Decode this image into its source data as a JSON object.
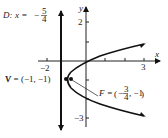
{
  "diagram": {
    "type": "parabola",
    "equation_note": "horizontal parabola opening right",
    "directrix": {
      "label": "D:",
      "lhs": "x =",
      "value_sign": "−",
      "num": "5",
      "den": "4"
    },
    "vertex": {
      "label": "V = (−1, −1)"
    },
    "focus": {
      "label_prefix": "F =",
      "x_sign": "−",
      "x_num": "3",
      "x_den": "4",
      "y": ", −1"
    },
    "axes": {
      "x_label": "x",
      "y_label": "y",
      "x_ticks": {
        "neg": "−2",
        "pos": "3"
      },
      "y_ticks": {
        "pos": "2",
        "neg": "−3"
      }
    }
  }
}
